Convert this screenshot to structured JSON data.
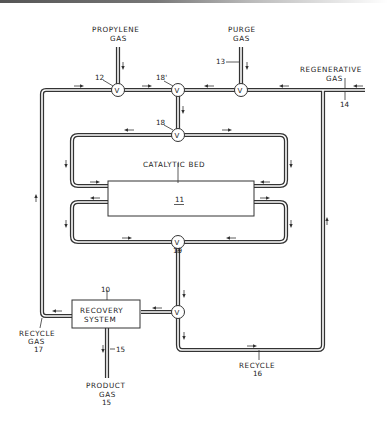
{
  "diagram": {
    "type": "process-flow",
    "labels": {
      "propylene_gas": [
        "PROPYLENE",
        "GAS"
      ],
      "purge_gas": [
        "PURGE",
        "GAS"
      ],
      "regenerative_gas": [
        "REGENERATIVE",
        "GAS"
      ],
      "catalytic_bed": "CATALYTIC BED",
      "recovery_system": [
        "RECOVERY",
        "SYSTEM"
      ],
      "recycle_gas": [
        "RECYCLE",
        "GAS",
        "17"
      ],
      "product_gas": [
        "PRODUCT",
        "GAS",
        "15"
      ],
      "recycle": [
        "RECYCLE",
        "16"
      ]
    },
    "reference_numbers": {
      "recovery_system": "10",
      "catalytic_bed": "11",
      "propylene_valve": "12",
      "purge_valve": "13",
      "regenerative_inlet": "14",
      "product_line": "15",
      "recycle_line": "16",
      "recycle_gas_line": "17",
      "valve_18": "18",
      "valve_18_prime": "18'",
      "valve_19": "19"
    },
    "valve_symbol": "V",
    "nodes": [
      {
        "id": "valve-12",
        "label": "V",
        "ref": "12"
      },
      {
        "id": "valve-18-prime",
        "label": "V",
        "ref": "18'"
      },
      {
        "id": "valve-13",
        "label": "V",
        "ref": "13"
      },
      {
        "id": "valve-18",
        "label": "V",
        "ref": "18"
      },
      {
        "id": "valve-19",
        "label": "V",
        "ref": "19"
      },
      {
        "id": "valve-recovery",
        "label": "V",
        "ref": ""
      },
      {
        "id": "catalytic-bed",
        "label": "CATALYTIC BED",
        "ref": "11"
      },
      {
        "id": "recovery-system",
        "label": "RECOVERY SYSTEM",
        "ref": "10"
      }
    ]
  }
}
